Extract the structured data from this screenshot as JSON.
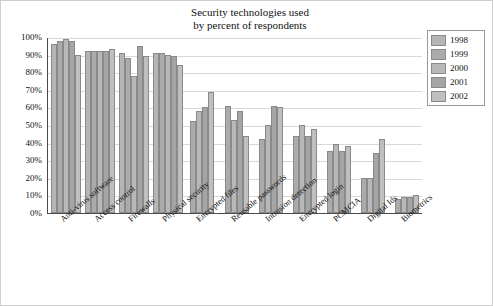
{
  "chart_data": {
    "type": "bar",
    "title": "Security technologies used by percent of respondents",
    "title_line1": "Security technologies used",
    "title_line2": "by percent of respondents",
    "xlabel": "",
    "ylabel": "",
    "ylim": [
      0,
      100
    ],
    "grid": true,
    "legend_position": "right",
    "ytick_labels": [
      "0%",
      "10%",
      "20%",
      "30%",
      "40%",
      "50%",
      "60%",
      "70%",
      "80%",
      "90%",
      "100%"
    ],
    "ytick_values": [
      0,
      10,
      20,
      30,
      40,
      50,
      60,
      70,
      80,
      90,
      100
    ],
    "categories": [
      "Anti-virus software",
      "Access control",
      "Firewalls",
      "Physical security",
      "Encrypted files",
      "Reusable passwords",
      "Intrusion detection",
      "Encrypted login",
      "PCMCIA",
      "Digital Ids",
      "Biometrics"
    ],
    "series": [
      {
        "name": "1998",
        "values": [
          96,
          92,
          91,
          91,
          0,
          0,
          0,
          0,
          0,
          0,
          0
        ]
      },
      {
        "name": "1999",
        "values": [
          98,
          92,
          88,
          91,
          52,
          61,
          42,
          44,
          35,
          20,
          8
        ]
      },
      {
        "name": "2000",
        "values": [
          99,
          92,
          78,
          90,
          58,
          53,
          50,
          50,
          39,
          20,
          9
        ]
      },
      {
        "name": "2001",
        "values": [
          98,
          92,
          95,
          89,
          60,
          58,
          61,
          44,
          35,
          34,
          9
        ]
      },
      {
        "name": "2002",
        "values": [
          90,
          93,
          89,
          84,
          69,
          44,
          60,
          48,
          38,
          42,
          10
        ]
      }
    ],
    "legend": [
      "1998",
      "1999",
      "2000",
      "2001",
      "2002"
    ],
    "series_colors": [
      "#b5b5b5",
      "#ababab",
      "#b8b8b8",
      "#a5a5a5",
      "#bfbfbf"
    ]
  }
}
